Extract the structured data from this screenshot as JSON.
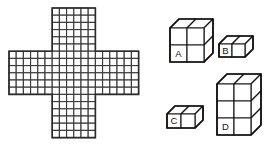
{
  "figure": {
    "background_color": "#ffffff",
    "stroke_color": "#2b2b2b",
    "cell_fill": "#ffffff"
  },
  "cross_grid": {
    "name": "plus-cross-grid",
    "shape": "plus",
    "bounding_columns": 18,
    "bounding_rows": 18,
    "arm_width_cells": 6,
    "arm_length_cells": 6,
    "total_cells": 180,
    "cell_size_px": 7.2,
    "origin_x_px": 9,
    "origin_y_px": 8
  },
  "blocks": [
    {
      "id": "A",
      "name": "block-a",
      "label": "A",
      "dimensions": {
        "width": 2,
        "height": 2,
        "depth": 2
      },
      "cube_count": 8,
      "unit_px": 17,
      "depth_px": 9,
      "origin_x_px": 170,
      "origin_y_px": 28,
      "label_col": 0,
      "label_row": 1
    },
    {
      "id": "B",
      "name": "block-b",
      "label": "B",
      "dimensions": {
        "width": 2,
        "height": 1,
        "depth": 1
      },
      "cube_count": 2,
      "unit_px": 13,
      "depth_px": 8,
      "origin_x_px": 219,
      "origin_y_px": 44,
      "label_col": 0,
      "label_row": 0
    },
    {
      "id": "C",
      "name": "block-c",
      "label": "C",
      "dimensions": {
        "width": 2,
        "height": 1,
        "depth": 1
      },
      "cube_count": 2,
      "unit_px": 14,
      "depth_px": 8,
      "origin_x_px": 167,
      "origin_y_px": 114,
      "label_col": 0,
      "label_row": 0
    },
    {
      "id": "D",
      "name": "block-d",
      "label": "D",
      "dimensions": {
        "width": 2,
        "height": 3,
        "depth": 2
      },
      "cube_count": 12,
      "unit_px": 17,
      "depth_px": 10,
      "origin_x_px": 217,
      "origin_y_px": 84,
      "label_col": 0,
      "label_row": 2
    }
  ],
  "labels": {
    "a": "A",
    "b": "B",
    "c": "C",
    "d": "D"
  }
}
